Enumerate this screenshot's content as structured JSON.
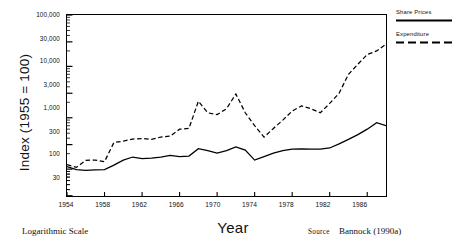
{
  "chart_data": {
    "type": "line",
    "title": "",
    "xlabel": "Year",
    "ylabel": "Index (1955 = 100)",
    "scale": "logarithmic",
    "grid": false,
    "legend_position": "right-outside",
    "xlim": [
      1954,
      1988
    ],
    "ylim": [
      30,
      100000
    ],
    "x_tick_labels": [
      "1954",
      "1958",
      "1962",
      "1966",
      "1970",
      "1974",
      "1978",
      "1982",
      "1986"
    ],
    "x_ticks": [
      1954,
      1958,
      1962,
      1966,
      1970,
      1974,
      1978,
      1982,
      1986
    ],
    "y_tick_labels": [
      "100,000",
      "30,000",
      "10,000",
      "3,000",
      "1,000",
      "300",
      "100",
      "30"
    ],
    "y_ticks": [
      100000,
      30000,
      10000,
      3000,
      1000,
      300,
      100,
      30
    ],
    "x": [
      1954,
      1955,
      1956,
      1957,
      1958,
      1959,
      1960,
      1961,
      1962,
      1963,
      1964,
      1965,
      1966,
      1967,
      1968,
      1969,
      1970,
      1971,
      1972,
      1973,
      1974,
      1975,
      1976,
      1977,
      1978,
      1979,
      1980,
      1981,
      1982,
      1983,
      1984,
      1985,
      1986,
      1987,
      1988
    ],
    "series": [
      {
        "name": "Share Prices",
        "style": "solid",
        "color": "#000000",
        "values": [
          112,
          98,
          95,
          97,
          98,
          120,
          150,
          172,
          160,
          163,
          172,
          185,
          175,
          180,
          250,
          230,
          205,
          230,
          270,
          235,
          150,
          175,
          205,
          230,
          245,
          248,
          245,
          245,
          258,
          310,
          380,
          470,
          600,
          800,
          700
        ]
      },
      {
        "name": "Expenditure",
        "style": "dashed",
        "color": "#000000",
        "values": [
          122,
          108,
          148,
          150,
          140,
          330,
          350,
          385,
          395,
          380,
          420,
          440,
          600,
          620,
          2100,
          1250,
          1150,
          1500,
          2900,
          1250,
          700,
          420,
          620,
          900,
          1350,
          1700,
          1500,
          1250,
          1900,
          3000,
          7000,
          11000,
          17000,
          20000,
          27000
        ]
      }
    ]
  },
  "axis": {
    "y_title": "Index (1955 = 100)",
    "x_title": "Year",
    "y_tick_labels": [
      "100,000",
      "30,000",
      "10,000",
      "3,000",
      "1,000",
      "300",
      "100",
      "30"
    ],
    "x_tick_labels": [
      "1954",
      "1958",
      "1962",
      "1966",
      "1970",
      "1974",
      "1978",
      "1982",
      "1986"
    ]
  },
  "legend": {
    "items": [
      {
        "label": "Share Prices",
        "style": "solid"
      },
      {
        "label": "Expenditure",
        "style": "dashed"
      }
    ]
  },
  "footnotes": {
    "scale_note": "Logarithmic Scale",
    "source_label": "Source",
    "source_text": "Bannock (1990a)"
  }
}
